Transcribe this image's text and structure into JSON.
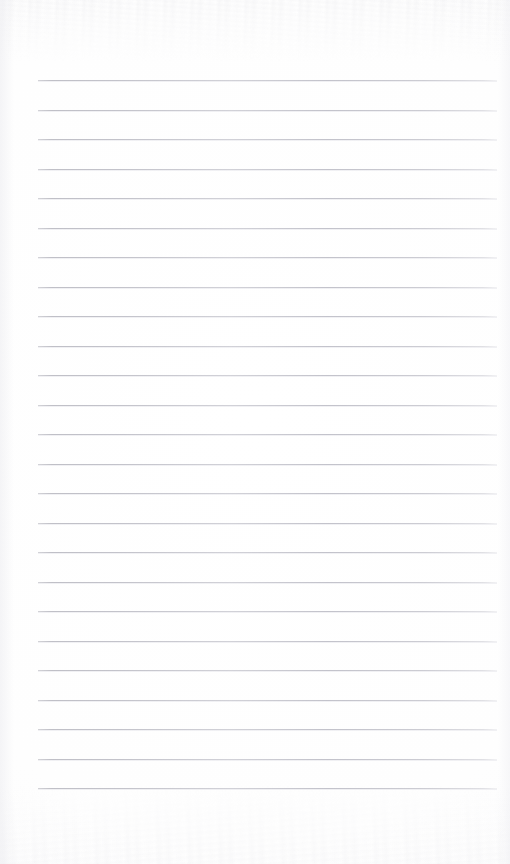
{
  "document": {
    "type": "ruled-notebook-page",
    "title": "Blank lined paper",
    "orientation": "portrait",
    "page_width": 510,
    "page_height": 864,
    "background_color": "#fefefe",
    "has_text_content": false,
    "content_text": ""
  },
  "ruling": {
    "style": "horizontal-ruled",
    "line_color": "#c0c0c8",
    "line_thickness": 1,
    "line_count": 25,
    "line_spacing": 29.5,
    "first_line_y": 80,
    "last_line_y": 788,
    "line_start_x": 38,
    "line_end_x": 497,
    "line_length": 459,
    "margin_left": 38,
    "margin_right": 13,
    "margin_top": 80,
    "margin_bottom": 76,
    "has_vertical_margin_rule": false
  },
  "lines": [
    {
      "index": 1,
      "y": 80,
      "text": ""
    },
    {
      "index": 2,
      "y": 110,
      "text": ""
    },
    {
      "index": 3,
      "y": 139,
      "text": ""
    },
    {
      "index": 4,
      "y": 169,
      "text": ""
    },
    {
      "index": 5,
      "y": 198,
      "text": ""
    },
    {
      "index": 6,
      "y": 228,
      "text": ""
    },
    {
      "index": 7,
      "y": 257,
      "text": ""
    },
    {
      "index": 8,
      "y": 287,
      "text": ""
    },
    {
      "index": 9,
      "y": 316,
      "text": ""
    },
    {
      "index": 10,
      "y": 346,
      "text": ""
    },
    {
      "index": 11,
      "y": 375,
      "text": ""
    },
    {
      "index": 12,
      "y": 405,
      "text": ""
    },
    {
      "index": 13,
      "y": 434,
      "text": ""
    },
    {
      "index": 14,
      "y": 464,
      "text": ""
    },
    {
      "index": 15,
      "y": 493,
      "text": ""
    },
    {
      "index": 16,
      "y": 523,
      "text": ""
    },
    {
      "index": 17,
      "y": 552,
      "text": ""
    },
    {
      "index": 18,
      "y": 582,
      "text": ""
    },
    {
      "index": 19,
      "y": 611,
      "text": ""
    },
    {
      "index": 20,
      "y": 641,
      "text": ""
    },
    {
      "index": 21,
      "y": 670,
      "text": ""
    },
    {
      "index": 22,
      "y": 700,
      "text": ""
    },
    {
      "index": 23,
      "y": 729,
      "text": ""
    },
    {
      "index": 24,
      "y": 759,
      "text": ""
    },
    {
      "index": 25,
      "y": 788,
      "text": ""
    }
  ],
  "texture": {
    "top_band_visible": true,
    "bottom_band_visible": true,
    "noise_color": "#e2e2e7"
  }
}
